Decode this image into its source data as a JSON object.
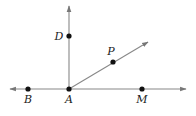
{
  "diagram": {
    "colors": {
      "line": "#888888",
      "point": "#111111",
      "label": "#1a1a1a"
    },
    "points": [
      {
        "id": "A",
        "label": "A",
        "x": 69,
        "y": 89,
        "label_x": 69,
        "label_y": 103
      },
      {
        "id": "B",
        "label": "B",
        "x": 28,
        "y": 89,
        "label_x": 28,
        "label_y": 103
      },
      {
        "id": "M",
        "label": "M",
        "x": 142,
        "y": 89,
        "label_x": 142,
        "label_y": 103
      },
      {
        "id": "D",
        "label": "D",
        "x": 69,
        "y": 36,
        "label_x": 59,
        "label_y": 40
      },
      {
        "id": "P",
        "label": "P",
        "x": 113,
        "y": 62,
        "label_x": 111,
        "label_y": 55
      }
    ],
    "lines": [
      {
        "id": "line-BM",
        "type": "line",
        "from": [
          10,
          89
        ],
        "to": [
          186,
          89
        ]
      },
      {
        "id": "ray-AD",
        "type": "ray",
        "from": [
          69,
          89
        ],
        "to": [
          69,
          6
        ]
      },
      {
        "id": "ray-AP",
        "type": "ray",
        "from": [
          69,
          89
        ],
        "to": [
          148,
          42
        ]
      }
    ]
  }
}
